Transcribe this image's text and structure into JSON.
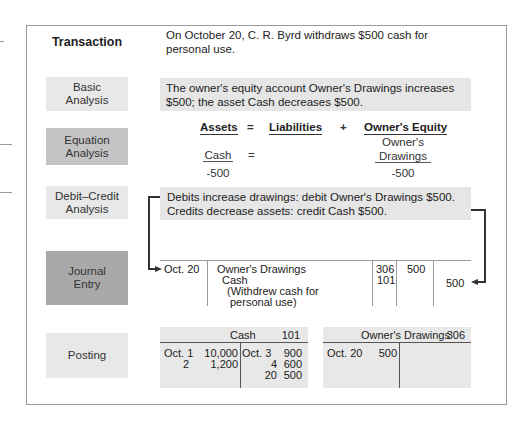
{
  "rows": {
    "transaction": {
      "label": "Transaction",
      "text_line1": "On October 20, C. R. Byrd withdraws $500 cash for",
      "text_line2": "personal use."
    },
    "basic_analysis": {
      "label_line1": "Basic",
      "label_line2": "Analysis",
      "text_line1": "The owner's equity account Owner's Drawings increases",
      "text_line2": "$500; the asset Cash decreases $500."
    },
    "equation_analysis": {
      "label_line1": "Equation",
      "label_line2": "Analysis",
      "headers": {
        "assets": "Assets",
        "equals": "=",
        "liabilities": "Liabilities",
        "plus": "+",
        "owners_equity": "Owner's Equity"
      },
      "assets_account": "Cash",
      "equals2": "=",
      "equity_account_line1": "Owner's",
      "equity_account_line2": "Drawings",
      "assets_change": "-500",
      "equity_change": "-500"
    },
    "debit_credit_analysis": {
      "label_line1": "Debit–Credit",
      "label_line2": "Analysis",
      "text_line1": "Debits increase drawings: debit Owner's Drawings $500.",
      "text_line2": "Credits decrease assets: credit Cash $500."
    },
    "journal_entry": {
      "label_line1": "Journal",
      "label_line2": "Entry",
      "date": "Oct. 20",
      "debit_account": "Owner's Drawings",
      "credit_account": "Cash",
      "explanation_line1": "(Withdrew cash for",
      "explanation_line2": "personal use)",
      "debit_ref": "306",
      "credit_ref": "101",
      "debit_amount": "500",
      "credit_amount": "500"
    },
    "posting": {
      "label": "Posting",
      "cash": {
        "title": "Cash",
        "number": "101",
        "debits": [
          {
            "date": "Oct. 1",
            "amount": "10,000"
          },
          {
            "date": "2",
            "amount": "1,200"
          }
        ],
        "credits": [
          {
            "date": "Oct. 3",
            "amount": "900"
          },
          {
            "date": "4",
            "amount": "600"
          },
          {
            "date": "20",
            "amount": "500"
          }
        ]
      },
      "owners_drawings": {
        "title": "Owner's Drawings",
        "number": "306",
        "debits": [
          {
            "date": "Oct. 20",
            "amount": "500"
          }
        ],
        "credits": []
      }
    }
  },
  "colors": {
    "light_label": "#e8e8e8",
    "mid_label": "#c4c4c4",
    "dark_label": "#a9a9a9",
    "shaded_text": "#e6e6e6",
    "connector": "#333333"
  }
}
